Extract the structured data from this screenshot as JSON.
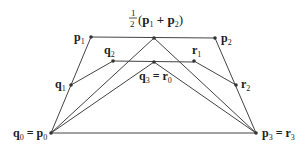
{
  "diagram": {
    "colors": {
      "line": "#444444",
      "point": "#333333",
      "text": "#222222",
      "background": "#ffffff"
    },
    "points": {
      "p0": {
        "x": 51,
        "y": 133
      },
      "p1": {
        "x": 91,
        "y": 37
      },
      "p2": {
        "x": 215,
        "y": 38
      },
      "p3": {
        "x": 256,
        "y": 133
      },
      "mid": {
        "x": 154,
        "y": 38
      },
      "q1": {
        "x": 71,
        "y": 85
      },
      "q2": {
        "x": 113,
        "y": 61
      },
      "q3": {
        "x": 154,
        "y": 62
      },
      "r1": {
        "x": 194,
        "y": 61
      },
      "r2": {
        "x": 236,
        "y": 85
      }
    },
    "labels": {
      "p1": {
        "main": "p",
        "sub": "1"
      },
      "p2": {
        "main": "p",
        "sub": "2"
      },
      "q1": {
        "main": "q",
        "sub": "1"
      },
      "q2": {
        "main": "q",
        "sub": "2"
      },
      "r1": {
        "main": "r",
        "sub": "1"
      },
      "r2": {
        "main": "r",
        "sub": "2"
      },
      "q3_r0": {
        "left": "q",
        "left_sub": "3",
        "eq": " = ",
        "right": "r",
        "right_sub": "0"
      },
      "q0_p0": {
        "left": "q",
        "left_sub": "0",
        "eq": " = ",
        "right": "p",
        "right_sub": "0"
      },
      "p3_r3": {
        "left": "p",
        "left_sub": "3",
        "eq": " = ",
        "right": "r",
        "right_sub": "3"
      },
      "midpoint": {
        "num": "1",
        "den": "2",
        "open": "(",
        "a": "p",
        "a_sub": "1",
        "plus": " + ",
        "b": "p",
        "b_sub": "2",
        "close": ")"
      }
    }
  }
}
